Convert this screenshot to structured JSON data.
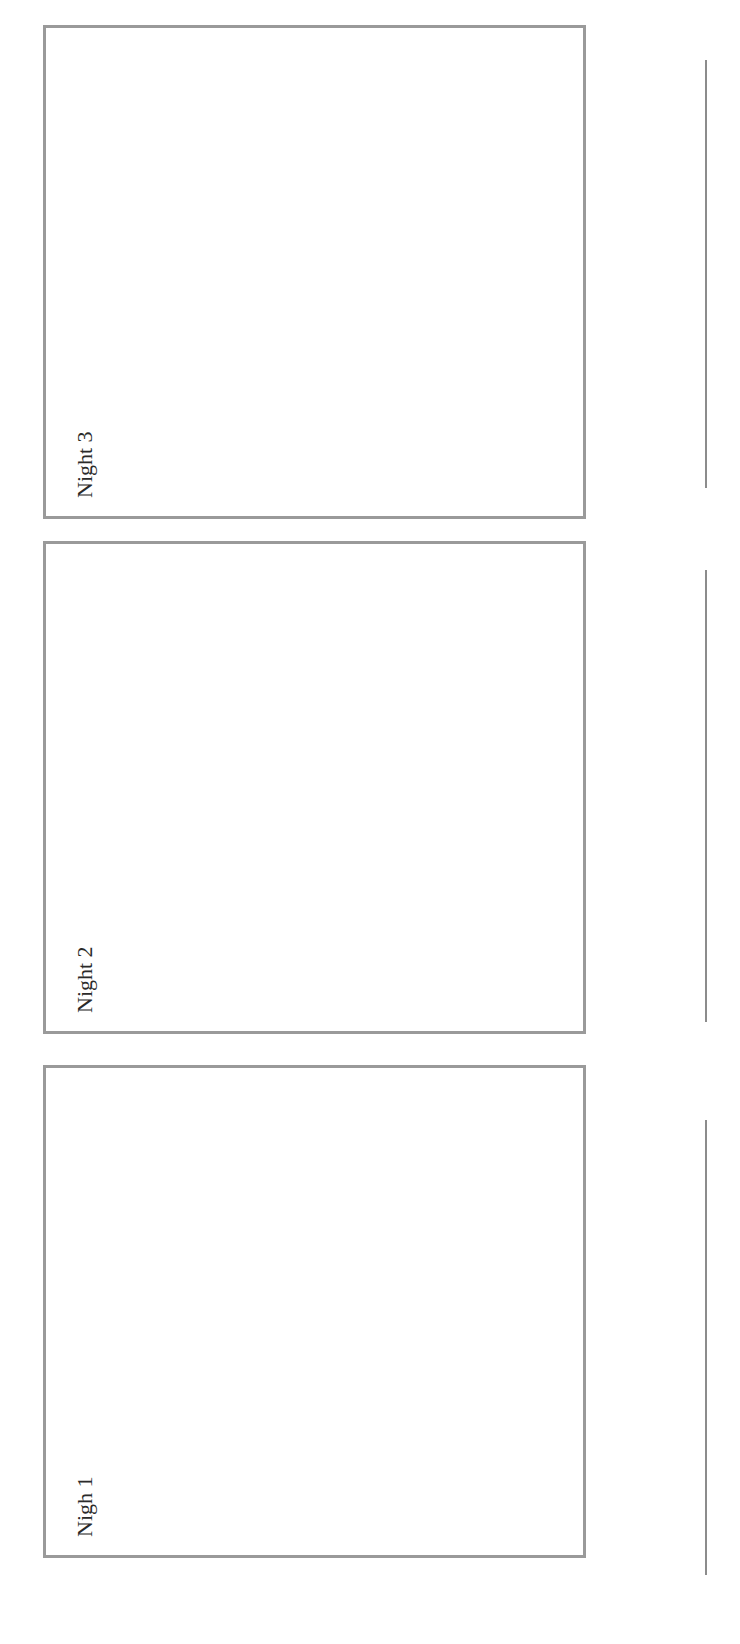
{
  "panels": [
    {
      "id": "night-3",
      "label": "Night 3"
    },
    {
      "id": "night-2",
      "label": "Night 2"
    },
    {
      "id": "night-1",
      "label": "Nigh 1"
    }
  ],
  "lines": [
    {
      "id": "line-night-3"
    },
    {
      "id": "line-night-2"
    },
    {
      "id": "line-night-1"
    }
  ],
  "colors": {
    "border": "#9a9a9a",
    "line": "#8c8c8c",
    "text": "#2a2a2a",
    "background": "#ffffff"
  }
}
